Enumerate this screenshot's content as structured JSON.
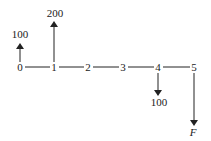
{
  "diagram": {
    "type": "cash-flow-diagram",
    "periods": [
      "0",
      "1",
      "2",
      "3",
      "4",
      "5"
    ],
    "cash_flows": [
      {
        "period": "0",
        "direction": "up",
        "label": "100"
      },
      {
        "period": "1",
        "direction": "up",
        "label": "200"
      },
      {
        "period": "4",
        "direction": "down",
        "label": "100"
      },
      {
        "period": "5",
        "direction": "down",
        "label": "F"
      }
    ]
  }
}
